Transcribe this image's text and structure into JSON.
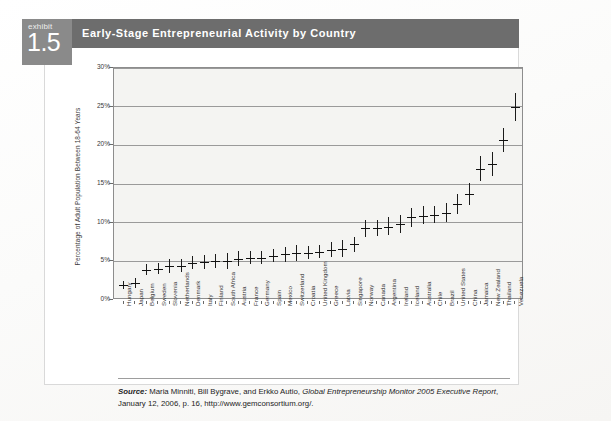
{
  "exhibit": {
    "label": "exhibit",
    "number": "1.5",
    "title": "Early-Stage Entrepreneurial Activity by Country"
  },
  "source": {
    "prefix": "Source:",
    "authors": " Maria Minniti, Bill Bygrave, and Erkko Autio, ",
    "work": "Global Entrepreneurship Monitor 2005 Executive Report",
    "rest": ", January 12, 2006, p. 16, http://www.gemconsortium.org/."
  },
  "chart_data": {
    "type": "scatter",
    "title": "Early-Stage Entrepreneurial Activity by Country",
    "xlabel": "",
    "ylabel": "Percentage of Adult Population Between 18-64 Years",
    "ylim": [
      0,
      30
    ],
    "yticks": [
      "0%",
      "5%",
      "10%",
      "15%",
      "20%",
      "25%",
      "30%"
    ],
    "ytick_values": [
      0,
      5,
      10,
      15,
      20,
      25,
      30
    ],
    "grid": true,
    "legend": "none",
    "marker_style": "point-with-confidence-interval",
    "categories": [
      "Hungary",
      "Japan",
      "Belgium",
      "Sweden",
      "Slovenia",
      "Netherlands",
      "Denmark",
      "Italy",
      "Finland",
      "South Africa",
      "Austria",
      "France",
      "Germany",
      "Spain",
      "Mexico",
      "Switzerland",
      "Croatia",
      "United Kingdom",
      "Greece",
      "Latvia",
      "Singapore",
      "Norway",
      "Canada",
      "Argentina",
      "Ireland",
      "Iceland",
      "Australia",
      "Chile",
      "Brazil",
      "United States",
      "China",
      "Jamaica",
      "New Zealand",
      "Thailand",
      "Venezuela"
    ],
    "values": [
      1.9,
      2.2,
      3.9,
      4.0,
      4.4,
      4.4,
      4.8,
      4.9,
      5.0,
      5.1,
      5.3,
      5.4,
      5.4,
      5.7,
      5.9,
      6.1,
      6.1,
      6.2,
      6.5,
      6.6,
      7.2,
      9.3,
      9.3,
      9.5,
      9.8,
      10.7,
      10.9,
      11.0,
      11.3,
      12.4,
      13.7,
      17.0,
      17.6,
      20.7,
      25.0
    ],
    "ci_low": [
      1.4,
      1.6,
      3.2,
      3.3,
      3.5,
      3.6,
      4.0,
      4.0,
      4.1,
      4.0,
      4.4,
      4.6,
      4.6,
      4.9,
      4.9,
      5.1,
      5.3,
      5.4,
      5.6,
      5.5,
      6.2,
      8.2,
      8.3,
      8.4,
      8.7,
      9.5,
      9.8,
      9.9,
      10.1,
      11.1,
      12.3,
      15.4,
      16.0,
      19.2,
      23.2
    ],
    "ci_high": [
      2.5,
      2.9,
      4.7,
      4.8,
      5.3,
      5.3,
      5.7,
      5.8,
      5.9,
      6.1,
      6.3,
      6.3,
      6.3,
      6.6,
      6.9,
      7.1,
      7.0,
      7.1,
      7.5,
      7.7,
      8.2,
      10.4,
      10.4,
      10.7,
      11.0,
      11.9,
      12.1,
      12.2,
      12.5,
      13.7,
      15.1,
      18.6,
      19.2,
      22.3,
      26.8
    ]
  }
}
